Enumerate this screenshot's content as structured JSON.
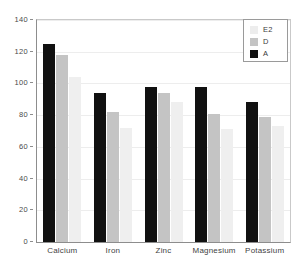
{
  "chart_data": {
    "type": "bar",
    "title": "",
    "xlabel": "",
    "ylabel": "",
    "ylim": [
      0,
      140
    ],
    "yticks": [
      0,
      20,
      40,
      60,
      80,
      100,
      120,
      140
    ],
    "grid": true,
    "legend_position": "top-right",
    "categories": [
      "Calcium",
      "Iron",
      "Zinc",
      "Magnesium",
      "Potassium"
    ],
    "series": [
      {
        "name": "A",
        "color": "#111111",
        "values": [
          125,
          94,
          98,
          98,
          88
        ]
      },
      {
        "name": "D",
        "color": "#c4c4c4",
        "values": [
          118,
          82,
          94,
          81,
          79
        ]
      },
      {
        "name": "E2",
        "color": "#ededed",
        "values": [
          104,
          72,
          88,
          71,
          73
        ]
      }
    ],
    "legend_order": [
      "E2",
      "D",
      "A"
    ]
  }
}
